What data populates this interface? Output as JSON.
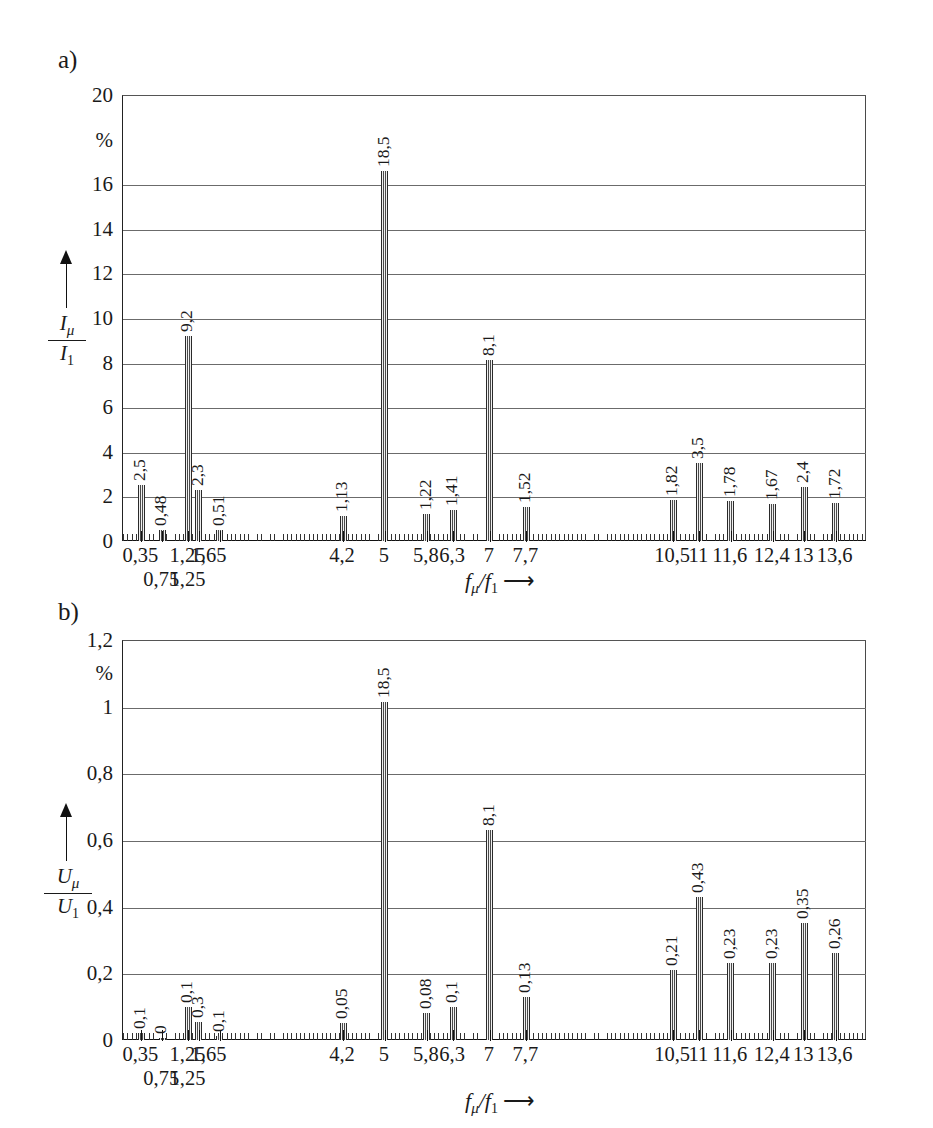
{
  "figure": {
    "panels": [
      {
        "letter": "a)",
        "y_unit": "%",
        "y_axis_title_num": "I",
        "y_axis_title_num_sub": "μ",
        "y_axis_title_den": "I",
        "y_axis_title_den_sub": "1",
        "x_axis_title": "fμ/f1"
      },
      {
        "letter": "b)",
        "y_unit": "%",
        "y_axis_title_num": "U",
        "y_axis_title_num_sub": "μ",
        "y_axis_title_den": "U",
        "y_axis_title_den_sub": "1",
        "x_axis_title": "fμ/f1"
      }
    ]
  },
  "chart_data": [
    {
      "type": "bar",
      "panel": "a)",
      "title": "",
      "xlabel": "f_μ/f_1",
      "ylabel": "I_μ/I_1",
      "yunit": "%",
      "ylim": [
        0,
        20
      ],
      "yticks": [
        0,
        2,
        4,
        6,
        8,
        10,
        12,
        14,
        16,
        18,
        20
      ],
      "ytick_labels": [
        "0",
        "2",
        "4",
        "6",
        "8",
        "10",
        "12",
        "14",
        "16",
        "%",
        "20"
      ],
      "grid": true,
      "xlim": [
        0,
        14.2
      ],
      "xtick_labels_row1": [
        {
          "x": 0.35,
          "label": "0,35"
        },
        {
          "x": 1.25,
          "label": "1,25"
        },
        {
          "x": 1.65,
          "label": "1,65"
        },
        {
          "x": 4.2,
          "label": "4,2"
        },
        {
          "x": 5,
          "label": "5"
        },
        {
          "x": 5.8,
          "label": "5,8"
        },
        {
          "x": 6.3,
          "label": "6,3"
        },
        {
          "x": 7,
          "label": "7"
        },
        {
          "x": 7.7,
          "label": "7,7"
        },
        {
          "x": 10.5,
          "label": "10,5"
        },
        {
          "x": 11,
          "label": "11"
        },
        {
          "x": 11.6,
          "label": "11,6"
        },
        {
          "x": 12.4,
          "label": "12,4"
        },
        {
          "x": 13,
          "label": "13"
        },
        {
          "x": 13.6,
          "label": "13,6"
        }
      ],
      "xtick_labels_row2": [
        {
          "x": 0.75,
          "label": "0,75"
        },
        {
          "x": 1.25,
          "label": "1,25"
        }
      ],
      "bars": [
        {
          "x": 0.35,
          "value": 2.5,
          "label": "2,5"
        },
        {
          "x": 0.75,
          "value": 0.48,
          "label": "0,48"
        },
        {
          "x": 1.25,
          "value": 9.2,
          "label": "9,2"
        },
        {
          "x": 1.45,
          "value": 2.3,
          "label": "2,3"
        },
        {
          "x": 1.85,
          "value": 0.51,
          "label": "0,51"
        },
        {
          "x": 4.2,
          "value": 1.13,
          "label": "1,13"
        },
        {
          "x": 5.0,
          "value": 16.6,
          "label": "18,5"
        },
        {
          "x": 5.8,
          "value": 1.22,
          "label": "1,22"
        },
        {
          "x": 6.3,
          "value": 1.41,
          "label": "1,41"
        },
        {
          "x": 7.0,
          "value": 8.1,
          "label": "8,1"
        },
        {
          "x": 7.7,
          "value": 1.52,
          "label": "1,52"
        },
        {
          "x": 10.5,
          "value": 1.82,
          "label": "1,82"
        },
        {
          "x": 11.0,
          "value": 3.5,
          "label": "3,5"
        },
        {
          "x": 11.6,
          "value": 1.78,
          "label": "1,78"
        },
        {
          "x": 12.4,
          "value": 1.67,
          "label": "1,67"
        },
        {
          "x": 13.0,
          "value": 2.4,
          "label": "2,4"
        },
        {
          "x": 13.6,
          "value": 1.72,
          "label": "1,72"
        }
      ]
    },
    {
      "type": "bar",
      "panel": "b)",
      "title": "",
      "xlabel": "f_μ/f_1",
      "ylabel": "U_μ/U_1",
      "yunit": "%",
      "ylim": [
        0,
        1.2
      ],
      "yticks": [
        0,
        0.2,
        0.4,
        0.6,
        0.8,
        1.0,
        1.1,
        1.2
      ],
      "ytick_labels": [
        "0",
        "0,2",
        "0,4",
        "0,6",
        "0,8",
        "1",
        "%",
        "1,2"
      ],
      "grid": true,
      "xlim": [
        0,
        14.2
      ],
      "xtick_labels_row1": [
        {
          "x": 0.35,
          "label": "0,35"
        },
        {
          "x": 1.25,
          "label": "1,25"
        },
        {
          "x": 1.65,
          "label": "1,65"
        },
        {
          "x": 4.2,
          "label": "4,2"
        },
        {
          "x": 5,
          "label": "5"
        },
        {
          "x": 5.8,
          "label": "5,8"
        },
        {
          "x": 6.3,
          "label": "6,3"
        },
        {
          "x": 7,
          "label": "7"
        },
        {
          "x": 7.7,
          "label": "7,7"
        },
        {
          "x": 10.5,
          "label": "10,5"
        },
        {
          "x": 11,
          "label": "11"
        },
        {
          "x": 11.6,
          "label": "11,6"
        },
        {
          "x": 12.4,
          "label": "12,4"
        },
        {
          "x": 13,
          "label": "13"
        },
        {
          "x": 13.6,
          "label": "13,6"
        }
      ],
      "xtick_labels_row2": [
        {
          "x": 0.75,
          "label": "0,75"
        },
        {
          "x": 1.25,
          "label": "1,25"
        }
      ],
      "bars": [
        {
          "x": 0.35,
          "value": 0.02,
          "label": "0,1"
        },
        {
          "x": 0.75,
          "value": 0.006,
          "label": "0"
        },
        {
          "x": 1.25,
          "value": 0.1,
          "label": "0,1"
        },
        {
          "x": 1.45,
          "value": 0.055,
          "label": "0,3"
        },
        {
          "x": 1.85,
          "value": 0.012,
          "label": "0,1"
        },
        {
          "x": 4.2,
          "value": 0.05,
          "label": "0,05"
        },
        {
          "x": 5.0,
          "value": 1.015,
          "label": "18,5"
        },
        {
          "x": 5.8,
          "value": 0.08,
          "label": "0,08"
        },
        {
          "x": 6.3,
          "value": 0.1,
          "label": "0,1"
        },
        {
          "x": 7.0,
          "value": 0.63,
          "label": "8,1"
        },
        {
          "x": 7.7,
          "value": 0.13,
          "label": "0,13"
        },
        {
          "x": 10.5,
          "value": 0.21,
          "label": "0,21"
        },
        {
          "x": 11.0,
          "value": 0.43,
          "label": "0,43"
        },
        {
          "x": 11.6,
          "value": 0.23,
          "label": "0,23"
        },
        {
          "x": 12.4,
          "value": 0.23,
          "label": "0,23"
        },
        {
          "x": 13.0,
          "value": 0.35,
          "label": "0,35"
        },
        {
          "x": 13.6,
          "value": 0.26,
          "label": "0,26"
        }
      ]
    }
  ]
}
